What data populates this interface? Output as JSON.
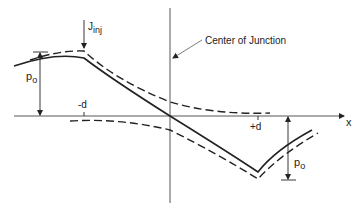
{
  "diagram": {
    "labels": {
      "current": "J",
      "current_sub": "inj",
      "center": "Center of Junction",
      "left_amplitude": "p",
      "left_amplitude_sub": "o",
      "right_amplitude": "p",
      "right_amplitude_sub": "o",
      "minus_d": "-d",
      "plus_d": "+d",
      "x_axis": "x"
    },
    "colors": {
      "line": "#222222",
      "background": "#ffffff"
    }
  }
}
